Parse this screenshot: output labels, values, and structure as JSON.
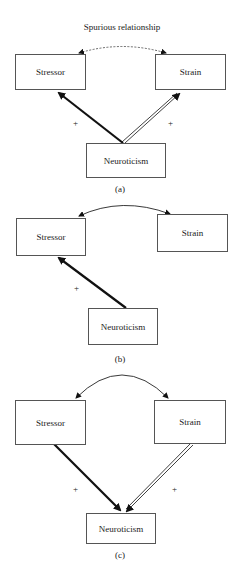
{
  "panels": [
    {
      "title": "Spurious relationship",
      "caption": "(a)",
      "nodes": {
        "stressor": "Stressor",
        "strain": "Strain",
        "neuroticism": "Neuroticism"
      },
      "edges": [
        {
          "from": "Neuroticism",
          "to": "Stressor",
          "sign": "+",
          "style": "thick-solid"
        },
        {
          "from": "Neuroticism",
          "to": "Strain",
          "sign": "+",
          "style": "double-line"
        },
        {
          "from": "Stressor",
          "to": "Strain",
          "style": "dashed-bidirectional"
        }
      ]
    },
    {
      "caption": "(b)",
      "nodes": {
        "stressor": "Stressor",
        "strain": "Strain",
        "neuroticism": "Neuroticism"
      },
      "edges": [
        {
          "from": "Neuroticism",
          "to": "Stressor",
          "sign": "+",
          "style": "thick-solid"
        },
        {
          "from": "Stressor",
          "to": "Strain",
          "style": "solid-bidirectional"
        }
      ]
    },
    {
      "caption": "(c)",
      "nodes": {
        "stressor": "Stressor",
        "strain": "Strain",
        "neuroticism": "Neuroticism"
      },
      "edges": [
        {
          "from": "Stressor",
          "to": "Neuroticism",
          "sign": "+",
          "style": "thick-solid"
        },
        {
          "from": "Strain",
          "to": "Neuroticism",
          "sign": "+",
          "style": "double-line"
        },
        {
          "from": "Stressor",
          "to": "Strain",
          "style": "solid-bidirectional"
        }
      ]
    }
  ]
}
